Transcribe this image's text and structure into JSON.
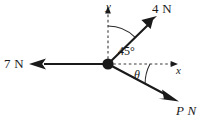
{
  "figure": {
    "type": "force-vector-diagram",
    "background_color": "#ffffff",
    "stroke_color": "#1a1a1a",
    "width": 197,
    "height": 127,
    "origin": {
      "x": 108,
      "y": 64
    },
    "axes": {
      "x": {
        "label": "x",
        "style": "dashed",
        "direction": "right",
        "arrow": true,
        "tip": {
          "x": 178,
          "y": 64
        }
      },
      "y": {
        "label": "y",
        "style": "dashed",
        "direction": "up",
        "arrow": true,
        "tip": {
          "x": 108,
          "y": 8
        }
      }
    },
    "vectors": [
      {
        "name": "force-4n",
        "label": "4 N",
        "magnitude": 4,
        "unit": "N",
        "angle_from_positive_x_deg": 45,
        "tip": {
          "x": 155,
          "y": 18
        },
        "style": "solid",
        "arrow": true
      },
      {
        "name": "force-7n",
        "label": "7 N",
        "magnitude": 7,
        "unit": "N",
        "angle_from_positive_x_deg": 180,
        "tip": {
          "x": 30,
          "y": 64
        },
        "style": "solid",
        "arrow": true
      },
      {
        "name": "force-pn",
        "label": "P N",
        "magnitude": "P",
        "unit": "N",
        "angle_from_positive_x_deg": -28,
        "tip": {
          "x": 178,
          "y": 101
        },
        "style": "solid",
        "arrow": true
      }
    ],
    "angles": [
      {
        "name": "angle-45",
        "label": "45°",
        "value": 45,
        "unit": "deg",
        "between": [
          "y-axis",
          "force-4n"
        ],
        "arc_radius": 38
      },
      {
        "name": "angle-theta",
        "label": "θ",
        "value": null,
        "unit": "deg",
        "between": [
          "x-axis",
          "force-pn"
        ],
        "arc_radius": 42
      }
    ],
    "origin_dot": {
      "name": "origin-point",
      "radius": 5.5,
      "fill": "#1a1a1a"
    }
  }
}
